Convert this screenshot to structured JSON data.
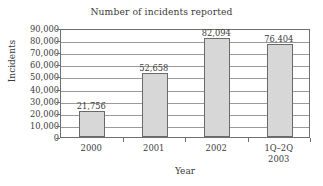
{
  "chart_data": {
    "type": "bar",
    "title": "Number of incidents reported",
    "xlabel": "Year",
    "ylabel": "Incidents",
    "categories": [
      "2000",
      "2001",
      "2002",
      "1Q–2Q 2003"
    ],
    "category_lines": [
      {
        "line1": "2000",
        "line2": ""
      },
      {
        "line1": "2001",
        "line2": ""
      },
      {
        "line1": "2002",
        "line2": ""
      },
      {
        "line1": "1Q–2Q",
        "line2": "2003"
      }
    ],
    "values": [
      21756,
      52658,
      82094,
      76404
    ],
    "value_labels": [
      "21,756",
      "52,658",
      "82,094",
      "76,404"
    ],
    "ylim": [
      0,
      90000
    ],
    "ytick_values": [
      0,
      10000,
      20000,
      30000,
      40000,
      50000,
      60000,
      70000,
      80000,
      90000
    ],
    "ytick_labels": [
      "0",
      "10,000",
      "20,000",
      "30,000",
      "40,000",
      "50,000",
      "60,000",
      "70,000",
      "80,000",
      "90,000"
    ],
    "grid": true,
    "legend": null,
    "bar_fill_color": "#d7d7d7",
    "bar_edge_color": "#6a6a6a",
    "grid_color": "#9a9a9a",
    "axis_color": "#6f6f6f",
    "text_color": "#3c3c3c",
    "background_color": "#ffffff"
  }
}
